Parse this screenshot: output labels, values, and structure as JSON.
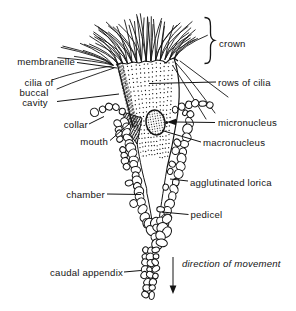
{
  "figure": {
    "type": "labeled-anatomical-diagram",
    "ink_color": "#141414",
    "background_color": "#ffffff"
  },
  "labels": {
    "membranelle": "membranelle",
    "cilia_buccal": {
      "line1": "cilia of",
      "line2": "buccal",
      "line3": "cavity"
    },
    "collar": "collar",
    "mouth": "mouth",
    "chamber": "chamber",
    "caudal_appendix": "caudal appendix",
    "crown": "crown",
    "rows_of_cilia": "rows of cilia",
    "micronucleus": "micronucleus",
    "macronucleus": "macronucleus",
    "agglutinated_lorica": "agglutinated lorica",
    "pedicel": "pedicel",
    "direction_of_movement": "direction of movement"
  }
}
